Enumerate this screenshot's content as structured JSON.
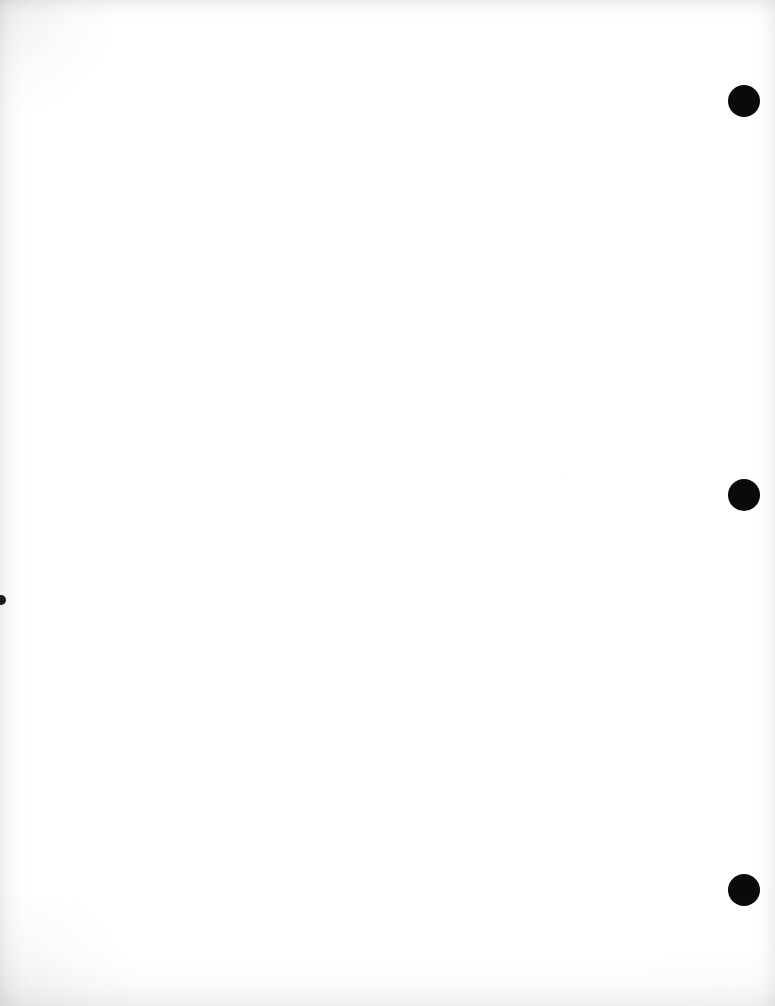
{
  "document": {
    "kind": "scanned-page",
    "content_text": "",
    "page_width": 775,
    "page_height": 1006,
    "paper_color": "#ffffff",
    "ink_color": "#0a0a0a",
    "edge_shadow_color": "#969698",
    "notes_label": ""
  },
  "marks": {
    "punch_holes": [
      {
        "name": "punch-hole-top",
        "cx": 744,
        "cy": 101,
        "r": 16,
        "color": "#0a0a0a"
      },
      {
        "name": "punch-hole-middle",
        "cx": 744,
        "cy": 495,
        "r": 16,
        "color": "#0a0a0a"
      },
      {
        "name": "punch-hole-bottom",
        "cx": 744,
        "cy": 890,
        "r": 16,
        "color": "#0a0a0a"
      }
    ],
    "edge_dots": [
      {
        "name": "left-edge-dot",
        "cx": 1,
        "cy": 600,
        "r": 5,
        "color": "#1a1a1a"
      }
    ]
  },
  "edges": {
    "top_label": "",
    "left_label": "",
    "right_label": "",
    "bottom_label": ""
  }
}
